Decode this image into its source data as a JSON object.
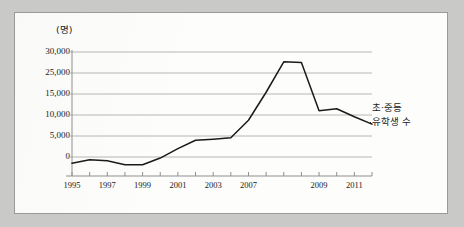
{
  "figure": {
    "unit_label": "(명)",
    "series_annotation_line1": "초·중등",
    "series_annotation_line2": "유학생 수",
    "line_color": "#1a1a1a",
    "grid_color": "#aeaeae",
    "axis_color": "#8f8f8f",
    "page_background": "#c9c9c7",
    "plot_background": "#fdfdfc"
  },
  "chart_data": {
    "type": "line",
    "title": "",
    "subtitle": "",
    "xlabel": "",
    "ylabel": "(명)",
    "grid": true,
    "legend_position": "right-inline-annotation",
    "annotations": [
      "초·중등",
      "유학생 수"
    ],
    "ylim": [
      -3000,
      30000
    ],
    "ytick_labels": [
      "30,000",
      "25,000",
      "15,000",
      "10,000",
      "5,000",
      "0"
    ],
    "ytick_values": [
      30000,
      25000,
      15000,
      10000,
      5000,
      0
    ],
    "xtick_labels": [
      "1995",
      "1997",
      "1999",
      "2001",
      "2003",
      "2007",
      "2009",
      "2011"
    ],
    "xtick_values": [
      1995,
      1997,
      1999,
      2001,
      2003,
      2005,
      2009,
      2011
    ],
    "x": [
      1995,
      1996,
      1997,
      1998,
      1999,
      2000,
      2001,
      2002,
      2003,
      2004,
      2005,
      2006,
      2007,
      2008,
      2009,
      2010,
      2011,
      2012
    ],
    "series": [
      {
        "name": "초·중등 유학생 수",
        "values": [
          -1800,
          -800,
          -1100,
          -2200,
          -2200,
          -300,
          2400,
          4800,
          5100,
          5500,
          10500,
          18500,
          27200,
          27000,
          13200,
          13800,
          11500,
          9400
        ]
      }
    ]
  }
}
